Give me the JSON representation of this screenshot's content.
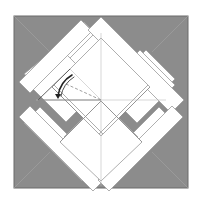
{
  "diagram": {
    "title": "",
    "type": "origami-fold-step",
    "colors": {
      "background": "#ffffff",
      "paper_back": "#8c8c8c",
      "paper_front": "#ffffff",
      "crease": "#b8b8b8",
      "edge": "#6a6a6a",
      "arrow": "#222222"
    },
    "annotations": {
      "fold_arrow": "curved-fold-arrow",
      "dashed_line": "valley-fold-line"
    }
  }
}
